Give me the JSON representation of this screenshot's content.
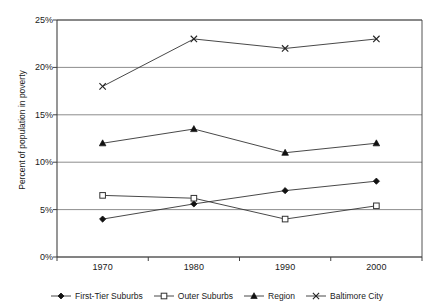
{
  "title_sliver": "",
  "axes": {
    "y_title": "Percent of population in poverty",
    "y_ticks": [
      "0%",
      "5%",
      "10%",
      "15%",
      "20%",
      "25%"
    ],
    "x_ticks": [
      "1970",
      "1980",
      "1990",
      "2000"
    ]
  },
  "legend": {
    "items": [
      {
        "label": "First-Tier Suburbs",
        "marker": "filled-diamond-marker"
      },
      {
        "label": "Outer Suburbs",
        "marker": "open-square-marker"
      },
      {
        "label": "Region",
        "marker": "filled-triangle-marker"
      },
      {
        "label": "Baltimore City",
        "marker": "cross-x-marker"
      }
    ]
  },
  "chart_data": {
    "type": "line",
    "title": "",
    "xlabel": "",
    "ylabel": "Percent of population in poverty",
    "categories": [
      "1970",
      "1980",
      "1990",
      "2000"
    ],
    "ylim": [
      0,
      25
    ],
    "ytick_values": [
      0,
      5,
      10,
      15,
      20,
      25
    ],
    "ytick_suffix": "%",
    "grid": "horizontal",
    "legend_position": "bottom",
    "series": [
      {
        "name": "First-Tier Suburbs",
        "marker": "filled-diamond",
        "values": [
          4.0,
          5.6,
          7.0,
          8.0
        ]
      },
      {
        "name": "Outer Suburbs",
        "marker": "open-square",
        "values": [
          6.5,
          6.2,
          4.0,
          5.4
        ]
      },
      {
        "name": "Region",
        "marker": "filled-triangle",
        "values": [
          12.0,
          13.5,
          11.0,
          12.0
        ]
      },
      {
        "name": "Baltimore City",
        "marker": "cross-x",
        "values": [
          18.0,
          23.0,
          22.0,
          23.0
        ]
      }
    ]
  },
  "colors": {
    "line": "#333333",
    "grid": "#808080",
    "axis": "#404040",
    "text": "#1a1a1a"
  }
}
